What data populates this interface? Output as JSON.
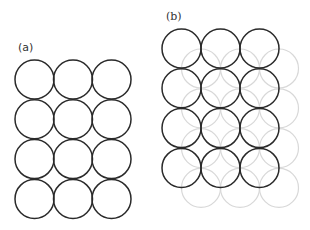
{
  "diagram": {
    "panels": [
      {
        "label": "(a)",
        "label_pos": [
          18,
          51
        ],
        "layers": [
          {
            "style": "dark",
            "color": "#2a2a2a",
            "radius": 19.5,
            "rows": 4,
            "cols": 3,
            "origin": [
              34.5,
              79.5
            ],
            "spacing": [
              38.5,
              39.8
            ]
          }
        ]
      },
      {
        "label": "(b)",
        "label_pos": [
          166,
          20
        ],
        "layers": [
          {
            "style": "light",
            "color": "#d8d8d8",
            "radius": 19.5,
            "rows": 4,
            "cols": 3,
            "origin": [
              201,
              68.5
            ],
            "spacing": [
              39,
              39.8
            ]
          },
          {
            "style": "dark",
            "color": "#2a2a2a",
            "radius": 19.5,
            "rows": 4,
            "cols": 3,
            "origin": [
              181.5,
              48.5
            ],
            "spacing": [
              39,
              39.8
            ]
          }
        ]
      }
    ]
  }
}
